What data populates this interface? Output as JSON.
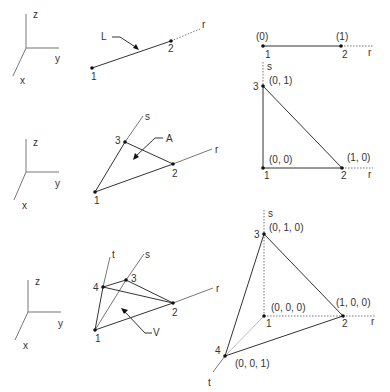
{
  "axes_triad": {
    "z": "z",
    "y": "y",
    "x": "x"
  },
  "row1": {
    "iso": {
      "element_label": "L",
      "axis": "r",
      "nodes": [
        "1",
        "2"
      ]
    },
    "natural": {
      "axis": "r",
      "nodes": [
        "1",
        "2"
      ],
      "coords": [
        "(0)",
        "(1)"
      ]
    }
  },
  "row2": {
    "iso": {
      "element_label": "A",
      "axes": [
        "r",
        "s"
      ],
      "nodes": [
        "1",
        "2",
        "3"
      ]
    },
    "natural": {
      "axes": [
        "r",
        "s"
      ],
      "nodes": [
        "1",
        "2",
        "3"
      ],
      "coords": [
        "(0, 0)",
        "(1, 0)",
        "(0, 1)"
      ]
    }
  },
  "row3": {
    "iso": {
      "element_label": "V",
      "axes": [
        "r",
        "s",
        "t"
      ],
      "nodes": [
        "1",
        "2",
        "3",
        "4"
      ]
    },
    "natural": {
      "axes": [
        "r",
        "s",
        "t"
      ],
      "nodes": [
        "1",
        "2",
        "3",
        "4"
      ],
      "coords": [
        "(0, 0, 0)",
        "(1, 0, 0)",
        "(0, 1, 0)",
        "(0, 0, 1)"
      ]
    }
  }
}
